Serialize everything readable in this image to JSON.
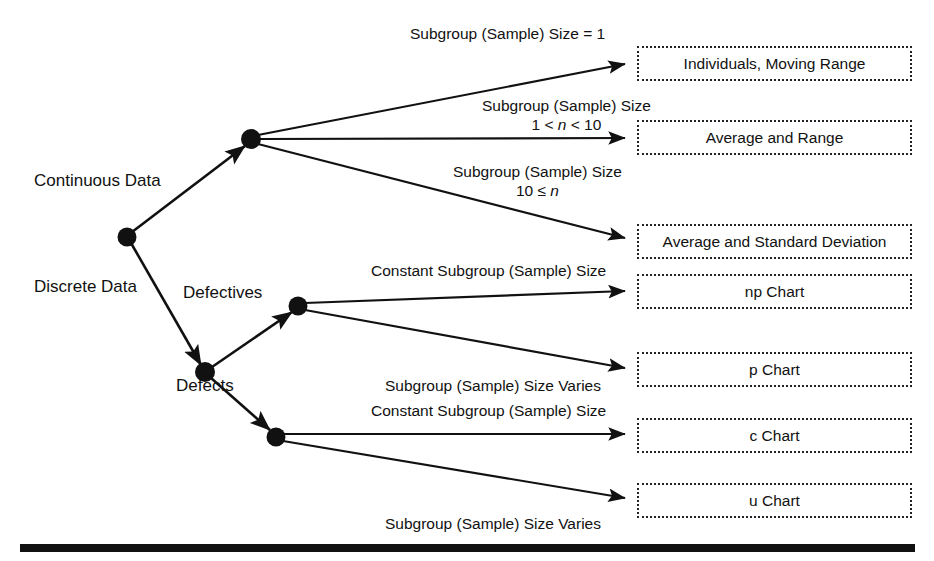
{
  "diagram": {
    "type": "decision-tree",
    "colors": {
      "line": "#111111",
      "node": "#111111",
      "box_border": "#222222",
      "text": "#111111",
      "background": "#ffffff"
    },
    "root_nodes": [
      {
        "id": "root",
        "label": "",
        "x": 127,
        "y": 237
      },
      {
        "id": "continuous-hub",
        "label": "",
        "x": 251,
        "y": 139
      },
      {
        "id": "discrete-hub",
        "label": "",
        "x": 205,
        "y": 372
      },
      {
        "id": "defectives-hub",
        "label": "",
        "x": 298,
        "y": 306
      },
      {
        "id": "defects-hub",
        "label": "",
        "x": 276,
        "y": 437
      }
    ],
    "branch_labels": [
      {
        "id": "continuous-data",
        "text": "Continuous Data",
        "x": 34,
        "y": 171
      },
      {
        "id": "discrete-data",
        "text": "Discrete Data",
        "x": 34,
        "y": 277
      },
      {
        "id": "defectives",
        "text": "Defectives",
        "x": 183,
        "y": 283
      },
      {
        "id": "defects",
        "text": "Defects",
        "x": 176,
        "y": 376
      }
    ],
    "edge_labels": [
      {
        "id": "subgroup-size-equals-1",
        "line1": "Subgroup (Sample) Size = 1",
        "line2": "",
        "x": 410,
        "y": 24
      },
      {
        "id": "subgroup-size-1-to-10",
        "line1": "Subgroup (Sample) Size",
        "line2_pre": "1 < ",
        "line2_ital": "n",
        "line2_post": " < 10",
        "x": 482,
        "y": 96
      },
      {
        "id": "subgroup-size-10-or-more",
        "line1": "Subgroup (Sample) Size",
        "line2_pre": "10 ≤ ",
        "line2_ital": "n",
        "line2_post": "",
        "x": 453,
        "y": 162
      },
      {
        "id": "constant-subgroup-size-np",
        "line1": "Constant Subgroup (Sample) Size",
        "line2": "",
        "x": 371,
        "y": 261
      },
      {
        "id": "subgroup-size-varies-p",
        "line1": "Subgroup (Sample) Size Varies",
        "line2": "",
        "x": 385,
        "y": 376
      },
      {
        "id": "constant-subgroup-size-c",
        "line1": "Constant Subgroup (Sample) Size",
        "line2": "",
        "x": 371,
        "y": 401
      },
      {
        "id": "subgroup-size-varies-u",
        "line1": "Subgroup (Sample) Size Varies",
        "line2": "",
        "x": 385,
        "y": 514
      }
    ],
    "outcomes": [
      {
        "id": "individuals-moving-range",
        "label": "Individuals, Moving Range",
        "x": 637,
        "y": 46,
        "w": 275,
        "h": 35
      },
      {
        "id": "average-and-range",
        "label": "Average and Range",
        "x": 637,
        "y": 120,
        "w": 275,
        "h": 35
      },
      {
        "id": "average-and-standard-deviation",
        "label": "Average and Standard Deviation",
        "x": 637,
        "y": 224,
        "w": 275,
        "h": 35
      },
      {
        "id": "np-chart",
        "label": "np Chart",
        "x": 637,
        "y": 274,
        "w": 275,
        "h": 35
      },
      {
        "id": "p-chart",
        "label": "p Chart",
        "x": 637,
        "y": 352,
        "w": 275,
        "h": 35
      },
      {
        "id": "c-chart",
        "label": "c Chart",
        "x": 637,
        "y": 418,
        "w": 275,
        "h": 35
      },
      {
        "id": "u-chart",
        "label": "u Chart",
        "x": 637,
        "y": 483,
        "w": 275,
        "h": 35
      }
    ]
  }
}
